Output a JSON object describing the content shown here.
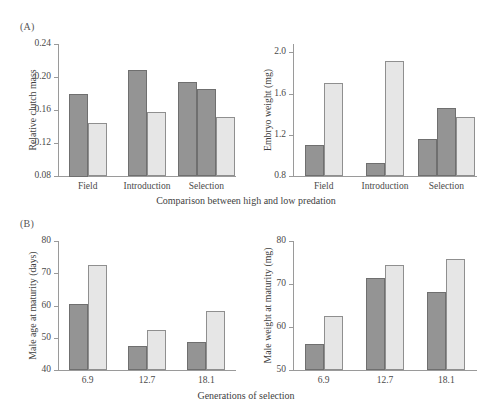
{
  "figure": {
    "panels": [
      {
        "tag": "(A)",
        "position": "top-left"
      },
      {
        "tag": "(B)",
        "position": "bottom-left"
      }
    ],
    "shared_axis_labels": {
      "top": "Comparison between high and low predation",
      "bottom": "Generations of selection"
    }
  },
  "chart_data": [
    {
      "id": "relative-clutch-mass",
      "type": "bar",
      "title": "",
      "panel": "(A)",
      "xlabel": "Comparison between high and low predation",
      "ylabel": "Relative clutch mass",
      "ylim": [
        0.08,
        0.24
      ],
      "yticks": [
        0.08,
        0.12,
        0.16,
        0.2,
        0.24
      ],
      "ytick_labels": [
        "0.08",
        "0.12",
        "0.16",
        "0.20",
        "0.24"
      ],
      "grid": false,
      "legend": "none",
      "categories": [
        "Field",
        "Introduction",
        "Selection"
      ],
      "groups": [
        {
          "category": "Field",
          "bars": [
            {
              "shade": "dark",
              "value": 0.18
            },
            {
              "shade": "light",
              "value": 0.144
            }
          ]
        },
        {
          "category": "Introduction",
          "bars": [
            {
              "shade": "dark",
              "value": 0.209
            },
            {
              "shade": "light",
              "value": 0.157
            }
          ]
        },
        {
          "category": "Selection",
          "bars": [
            {
              "shade": "dark",
              "value": 0.194
            },
            {
              "shade": "dark",
              "value": 0.185
            },
            {
              "shade": "light",
              "value": 0.151
            }
          ]
        }
      ]
    },
    {
      "id": "embryo-weight",
      "type": "bar",
      "title": "",
      "panel": "(A)",
      "xlabel": "Comparison between high and low predation",
      "ylabel": "Embryo weight (mg)",
      "ylim": [
        0.8,
        2.08
      ],
      "yticks": [
        0.8,
        1.2,
        1.6,
        2.0
      ],
      "ytick_labels": [
        "0.8",
        "1.2",
        "1.6",
        "2.0"
      ],
      "grid": false,
      "legend": "none",
      "categories": [
        "Field",
        "Introduction",
        "Selection"
      ],
      "groups": [
        {
          "category": "Field",
          "bars": [
            {
              "shade": "dark",
              "value": 1.1
            },
            {
              "shade": "light",
              "value": 1.7
            }
          ]
        },
        {
          "category": "Introduction",
          "bars": [
            {
              "shade": "dark",
              "value": 0.93
            },
            {
              "shade": "light",
              "value": 1.92
            }
          ]
        },
        {
          "category": "Selection",
          "bars": [
            {
              "shade": "dark",
              "value": 1.16
            },
            {
              "shade": "dark",
              "value": 1.46
            },
            {
              "shade": "light",
              "value": 1.37
            }
          ]
        }
      ]
    },
    {
      "id": "male-age-at-maturity",
      "type": "bar",
      "title": "",
      "panel": "(B)",
      "xlabel": "Generations of selection",
      "ylabel": "Male age at maturity (days)",
      "ylim": [
        40,
        80
      ],
      "yticks": [
        40,
        50,
        60,
        70,
        80
      ],
      "ytick_labels": [
        "40",
        "50",
        "60",
        "70",
        "80"
      ],
      "grid": false,
      "legend": "none",
      "categories": [
        "6.9",
        "12.7",
        "18.1"
      ],
      "groups": [
        {
          "category": "6.9",
          "bars": [
            {
              "shade": "dark",
              "value": 60.5
            },
            {
              "shade": "light",
              "value": 72.6
            }
          ]
        },
        {
          "category": "12.7",
          "bars": [
            {
              "shade": "dark",
              "value": 47.3
            },
            {
              "shade": "light",
              "value": 52.4
            }
          ]
        },
        {
          "category": "18.1",
          "bars": [
            {
              "shade": "dark",
              "value": 48.6
            },
            {
              "shade": "light",
              "value": 58.3
            }
          ]
        }
      ]
    },
    {
      "id": "male-weight-at-maturity",
      "type": "bar",
      "title": "",
      "panel": "(B)",
      "xlabel": "Generations of selection",
      "ylabel": "Male weight at maturity (mg)",
      "ylim": [
        50,
        80
      ],
      "yticks": [
        50,
        60,
        70,
        80
      ],
      "ytick_labels": [
        "50",
        "60",
        "70",
        "80"
      ],
      "grid": false,
      "legend": "none",
      "categories": [
        "6.9",
        "12.7",
        "18.1"
      ],
      "groups": [
        {
          "category": "6.9",
          "bars": [
            {
              "shade": "dark",
              "value": 56.1
            },
            {
              "shade": "light",
              "value": 62.5
            }
          ]
        },
        {
          "category": "12.7",
          "bars": [
            {
              "shade": "dark",
              "value": 71.5
            },
            {
              "shade": "light",
              "value": 74.4
            }
          ]
        },
        {
          "category": "18.1",
          "bars": [
            {
              "shade": "dark",
              "value": 68.1
            },
            {
              "shade": "light",
              "value": 75.9
            }
          ]
        }
      ]
    }
  ],
  "colors": {
    "bar_dark": "#949494",
    "bar_light": "#e6e6e6",
    "axis": "#9a9a9a",
    "text": "#3f3f3f",
    "background": "#ffffff"
  }
}
